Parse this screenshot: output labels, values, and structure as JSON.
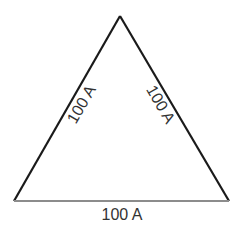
{
  "diagram": {
    "type": "triangle",
    "vertices": {
      "apex": [
        120,
        16
      ],
      "bottom_left": [
        14,
        201
      ],
      "bottom_right": [
        229,
        201
      ]
    },
    "sides": [
      {
        "id": "left",
        "label": "100 A",
        "color": "#1a1a1a"
      },
      {
        "id": "right",
        "label": "100 A",
        "color": "#1a1a1a"
      },
      {
        "id": "bottom",
        "label": "100 A",
        "color": "#8c8c8c"
      }
    ]
  }
}
